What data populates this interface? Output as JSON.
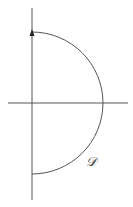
{
  "diagram": {
    "title": "",
    "type": "nyquist-d-contour",
    "contour_label": "𝒟",
    "colors": {
      "stroke": "#555555",
      "background": "#ffffff"
    },
    "axes": {
      "real_axis": {
        "x1": 8,
        "x2": 128,
        "y": 103
      },
      "imag_axis": {
        "x": 32,
        "y1": 8,
        "y2": 200
      }
    },
    "contour": {
      "cx": 32,
      "cy": 103,
      "r": 71,
      "direction": "counterclockwise-up-imag-axis"
    },
    "arrow": {
      "x": 32,
      "y": 31
    },
    "label_pos": {
      "x": 88,
      "y": 164
    }
  }
}
